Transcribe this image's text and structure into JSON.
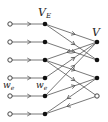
{
  "labels": {
    "middle_set": "V",
    "middle_set_sub": "E",
    "right_set": "V",
    "weight_left": "w",
    "weight_left_sub": "e",
    "weight_mid": "w",
    "weight_mid_sub": "e"
  },
  "colors": {
    "edge": "#555555",
    "node_filled": "#111111",
    "node_open_stroke": "#333333",
    "background": "#ffffff"
  },
  "nodes": {
    "left": [
      {
        "x": 10,
        "y": 24,
        "type": "open"
      },
      {
        "x": 10,
        "y": 42,
        "type": "open"
      },
      {
        "x": 10,
        "y": 60,
        "type": "open"
      },
      {
        "x": 10,
        "y": 78,
        "type": "open"
      },
      {
        "x": 10,
        "y": 96,
        "type": "open"
      },
      {
        "x": 10,
        "y": 114,
        "type": "open"
      }
    ],
    "middle": [
      {
        "x": 45,
        "y": 24,
        "type": "filled"
      },
      {
        "x": 45,
        "y": 42,
        "type": "filled"
      },
      {
        "x": 45,
        "y": 60,
        "type": "filled"
      },
      {
        "x": 45,
        "y": 78,
        "type": "filled"
      },
      {
        "x": 45,
        "y": 96,
        "type": "filled"
      },
      {
        "x": 45,
        "y": 114,
        "type": "filled"
      }
    ],
    "right": [
      {
        "x": 97,
        "y": 42,
        "type": "filled"
      },
      {
        "x": 97,
        "y": 60,
        "type": "filled"
      },
      {
        "x": 97,
        "y": 78,
        "type": "filled"
      },
      {
        "x": 97,
        "y": 96,
        "type": "open"
      }
    ]
  },
  "edges": [
    {
      "from": "L0",
      "to": "M0"
    },
    {
      "from": "L1",
      "to": "M1"
    },
    {
      "from": "L2",
      "to": "M2"
    },
    {
      "from": "L3",
      "to": "M3"
    },
    {
      "from": "L4",
      "to": "M4"
    },
    {
      "from": "L5",
      "to": "M5"
    },
    {
      "from": "M0",
      "to": "R0"
    },
    {
      "from": "M0",
      "to": "R1"
    },
    {
      "from": "M1",
      "to": "R1"
    },
    {
      "from": "R0",
      "to": "M2"
    },
    {
      "from": "M2",
      "to": "R3"
    },
    {
      "from": "M2",
      "to": "R2"
    },
    {
      "from": "M3",
      "to": "R0"
    },
    {
      "from": "M4",
      "to": "R0"
    },
    {
      "from": "M4",
      "to": "R2"
    },
    {
      "from": "R2",
      "to": "M5"
    },
    {
      "from": "R3",
      "to": "M5"
    }
  ]
}
